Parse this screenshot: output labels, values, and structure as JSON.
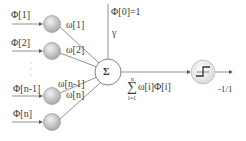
{
  "diagram": {
    "type": "perceptron",
    "inputs": [
      {
        "label": "Φ[1]",
        "weight": "ω[1]"
      },
      {
        "label": "Φ[2]",
        "weight": "ω[2]"
      },
      {
        "label": "Φ[n-1]",
        "weight": "ω[n-1]"
      },
      {
        "label": "Φ[n]",
        "weight": "ω[n]"
      }
    ],
    "ellipsis": "·\n·\n·",
    "bias": {
      "label": "Φ[0]=1",
      "weight": "γ"
    },
    "summation": {
      "symbol": "Σ"
    },
    "sum_expression": {
      "sigma": "∑",
      "upper": "n",
      "lower": "i=1",
      "body": "ω[i]Φ[i]"
    },
    "activation": {
      "name": "step-function",
      "output": "-1/1"
    },
    "colors": {
      "line": "#6a6a6a",
      "node_fill": "#c9c9c9",
      "node_stroke": "#8a8a8a"
    }
  }
}
